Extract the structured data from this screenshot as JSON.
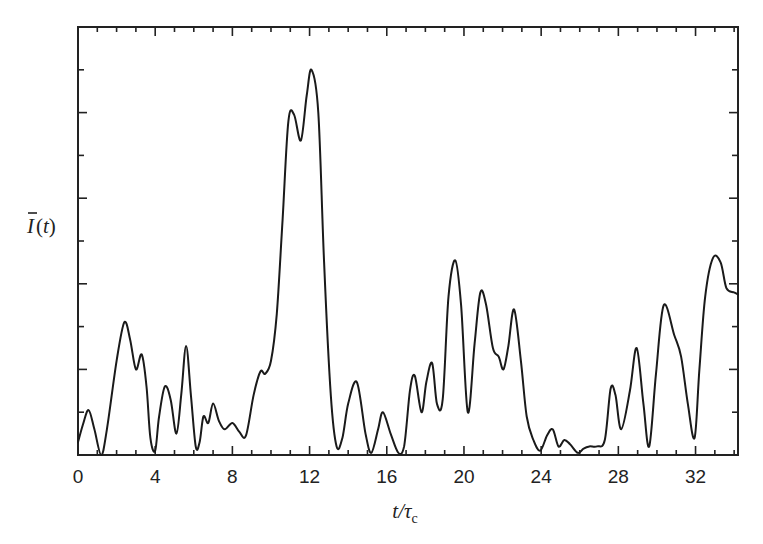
{
  "chart_data": {
    "type": "line",
    "title": "",
    "xlabel": "t/τc",
    "xlabel_parts": {
      "main": "t/τ",
      "sub": "c"
    },
    "ylabel": "Ī(t)",
    "ylabel_parts": {
      "main": "I",
      "arg": "(t)"
    },
    "xlim": [
      0,
      34.2
    ],
    "ylim": [
      0,
      10
    ],
    "x_ticks": [
      0,
      4,
      8,
      12,
      16,
      20,
      24,
      28,
      32
    ],
    "x_tick_labels": [
      "0",
      "4",
      "8",
      "12",
      "16",
      "20",
      "24",
      "28",
      "32"
    ],
    "x_minor_step": 1,
    "y_ticks": [
      1,
      2,
      3,
      4,
      5,
      6,
      7,
      8,
      9
    ],
    "y_tick_labels": [],
    "grid": false,
    "legend": null,
    "series": [
      {
        "name": "Ī(t)",
        "color": "#1a1a1a",
        "x": [
          0,
          0.25,
          0.55,
          0.85,
          1.2,
          1.5,
          2.0,
          2.4,
          2.7,
          3.0,
          3.3,
          3.55,
          3.75,
          4.0,
          4.2,
          4.5,
          4.8,
          5.1,
          5.35,
          5.6,
          5.85,
          6.1,
          6.3,
          6.5,
          6.75,
          7.0,
          7.3,
          7.6,
          8.0,
          8.35,
          8.7,
          9.1,
          9.45,
          9.7,
          10.0,
          10.3,
          10.6,
          10.9,
          11.2,
          11.55,
          11.85,
          12.1,
          12.45,
          12.75,
          13.1,
          13.4,
          13.7,
          14.0,
          14.45,
          14.9,
          15.2,
          15.55,
          15.8,
          16.2,
          16.6,
          16.9,
          17.2,
          17.45,
          17.8,
          18.05,
          18.35,
          18.6,
          18.9,
          19.2,
          19.55,
          19.85,
          20.2,
          20.55,
          20.85,
          21.15,
          21.5,
          21.8,
          22.05,
          22.3,
          22.6,
          22.95,
          23.25,
          23.6,
          23.95,
          24.3,
          24.6,
          24.9,
          25.2,
          25.5,
          25.9,
          26.2,
          26.5,
          26.9,
          27.3,
          27.6,
          27.85,
          28.15,
          28.6,
          28.95,
          29.3,
          29.6,
          29.95,
          30.35,
          30.9,
          31.25,
          31.6,
          31.95,
          32.2,
          32.5,
          32.9,
          33.3,
          33.6,
          34.0,
          34.2
        ],
        "y": [
          0.3,
          0.7,
          1.05,
          0.6,
          0,
          0.6,
          2.2,
          3.1,
          2.7,
          2.0,
          2.35,
          1.6,
          0.4,
          0.1,
          0.9,
          1.6,
          1.3,
          0.5,
          1.4,
          2.55,
          1.4,
          0.2,
          0.3,
          0.9,
          0.75,
          1.2,
          0.8,
          0.6,
          0.75,
          0.55,
          0.45,
          1.4,
          1.95,
          1.9,
          2.2,
          3.3,
          5.5,
          7.8,
          7.95,
          7.35,
          8.4,
          9.0,
          8.0,
          4.5,
          1.4,
          0.2,
          0.4,
          1.2,
          1.7,
          0.5,
          0.05,
          0.6,
          1.0,
          0.5,
          0.05,
          0.2,
          1.5,
          1.85,
          1.0,
          1.7,
          2.15,
          1.2,
          1.3,
          3.7,
          4.55,
          3.5,
          1.0,
          2.6,
          3.8,
          3.5,
          2.5,
          2.3,
          2.0,
          2.55,
          3.4,
          2.2,
          0.9,
          0.35,
          0.1,
          0.45,
          0.6,
          0.2,
          0.35,
          0.25,
          0.05,
          0.15,
          0.2,
          0.2,
          0.35,
          1.55,
          1.4,
          0.6,
          1.5,
          2.5,
          1.2,
          0.2,
          1.9,
          3.5,
          2.8,
          2.3,
          1.2,
          0.4,
          2.0,
          3.7,
          4.6,
          4.5,
          3.9,
          3.8,
          3.75
        ]
      }
    ]
  },
  "plot_box": {
    "left": 78,
    "top": 27,
    "right": 738,
    "bottom": 455
  },
  "colors": {
    "line": "#1a1a1a",
    "axis": "#222222",
    "background": "#ffffff"
  }
}
